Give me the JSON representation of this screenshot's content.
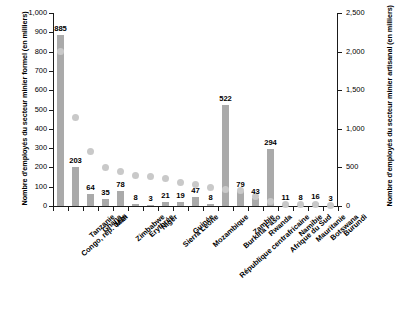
{
  "chart_data": {
    "type": "bar",
    "title": "",
    "xlabel": "",
    "ylabel": "Nombre d'employés du secteur minier formel (en milliers)",
    "y2label": "Nombre d'employés du secteur minier artisanal (en milliers)",
    "ylim": [
      0,
      1000
    ],
    "y2lim": [
      0,
      2500
    ],
    "yticks": [
      "0",
      "100",
      "200",
      "300",
      "400",
      "500",
      "600",
      "700",
      "800",
      "900",
      "1,000"
    ],
    "ytick_values": [
      0,
      100,
      200,
      300,
      400,
      500,
      600,
      700,
      800,
      900,
      1000
    ],
    "y2ticks": [
      "0",
      "500",
      "1,000",
      "1,500",
      "2,000",
      "2,500"
    ],
    "y2tick_values": [
      0,
      500,
      1000,
      1500,
      2000,
      2500
    ],
    "grid": false,
    "legend": "none",
    "categories": [
      "Congo, rép. dém",
      "Tanzanie",
      "Ghana",
      "Mali",
      "Zimbabwe",
      "Érythrée",
      "Niger",
      "Sierra Leone",
      "Guinée",
      "Mozambique",
      "République centrafricaine",
      "Burkina Faso",
      "Zambie",
      "Rwanda",
      "Afrique du Sud",
      "Namibie",
      "Mauritanie",
      "Botswana",
      "Burundi"
    ],
    "series": [
      {
        "name": "Secteur minier formel",
        "axis": "left",
        "type": "bar",
        "values": [
          885,
          203,
          64,
          35,
          78,
          8,
          3,
          21,
          19,
          47,
          8,
          522,
          79,
          43,
          294,
          11,
          8,
          16,
          3
        ],
        "labels": [
          "885",
          "203",
          "64",
          "35",
          "78",
          "8",
          "3",
          "21",
          "19",
          "47",
          "8",
          "522",
          "79",
          "43",
          "294",
          "11",
          "8",
          "16",
          "3"
        ]
      },
      {
        "name": "Secteur minier artisanal",
        "axis": "right",
        "type": "scatter",
        "values": [
          2000,
          1150,
          700,
          500,
          450,
          400,
          380,
          360,
          300,
          275,
          240,
          220,
          200,
          120,
          60,
          25,
          20,
          15,
          10
        ]
      }
    ]
  }
}
